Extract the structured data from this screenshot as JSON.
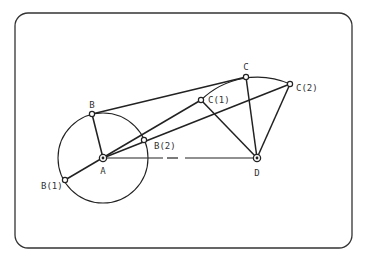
{
  "diagram": {
    "type": "four-bar linkage (crank-rocker) extreme positions",
    "frame": {
      "x": 15,
      "y": 13,
      "width": 337,
      "height": 235,
      "radius": 13
    },
    "colors": {
      "stroke": "#222222",
      "background": "#ffffff",
      "label": "#333333"
    },
    "points": {
      "A": {
        "x": 103,
        "y": 158,
        "label": "A",
        "lx": 103,
        "ly": 174,
        "anchor": "middle",
        "pivot": true
      },
      "B": {
        "x": 92,
        "y": 114,
        "label": "B",
        "lx": 92,
        "ly": 108,
        "anchor": "middle"
      },
      "B1": {
        "x": 65,
        "y": 180,
        "label": "B(1)",
        "lx": 41,
        "ly": 189,
        "anchor": "start"
      },
      "B2": {
        "x": 144,
        "y": 140,
        "label": "B(2)",
        "lx": 154,
        "ly": 149,
        "anchor": "start"
      },
      "C": {
        "x": 246,
        "y": 77,
        "label": "C",
        "lx": 246,
        "ly": 70,
        "anchor": "middle"
      },
      "C1": {
        "x": 201,
        "y": 100,
        "label": "C(1)",
        "lx": 208,
        "ly": 103,
        "anchor": "start"
      },
      "C2": {
        "x": 290,
        "y": 84,
        "label": "C(2)",
        "lx": 296,
        "ly": 91,
        "anchor": "start"
      },
      "D": {
        "x": 257,
        "y": 158,
        "label": "D",
        "lx": 257,
        "ly": 176,
        "anchor": "middle",
        "pivot": true
      }
    },
    "crank_circle": {
      "center": "A",
      "radius": 45
    },
    "links": [
      [
        "A",
        "B"
      ],
      [
        "B",
        "C"
      ],
      [
        "C",
        "D"
      ],
      [
        "B1",
        "C1"
      ],
      [
        "C1",
        "D"
      ],
      [
        "A",
        "C2"
      ],
      [
        "C2",
        "D"
      ]
    ],
    "ground_link": {
      "from": "A",
      "to": "D",
      "dash": [
        163,
        167,
        178,
        185
      ]
    },
    "rocker_arc": {
      "center": "D",
      "from": "C1",
      "to": "C2"
    }
  }
}
